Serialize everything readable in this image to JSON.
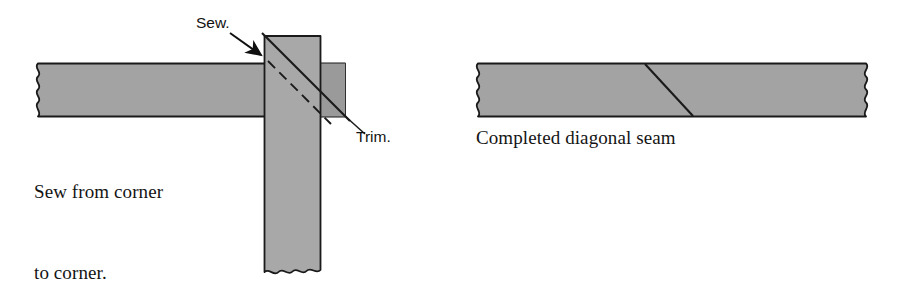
{
  "figure": {
    "background_color": "#ffffff",
    "fabric_fill": "#a3a3a3",
    "fabric_fill_overlap": "#999999",
    "outline_color": "#1a1a1a",
    "text_color": "#141414"
  },
  "panels": {
    "left": {
      "name": "sew-from-corner-panel",
      "caption_line_1": "Sew from corner",
      "caption_line_2": "to corner.",
      "annotations": {
        "sew": {
          "label": "Sew.",
          "icon": "arrow-icon",
          "points_to": "top-left-corner-of-vertical-strip"
        },
        "trim": {
          "label": "Trim.",
          "icon": "leader-line-icon",
          "points_to": "end-of-diagonal-cut-line"
        }
      },
      "shapes": {
        "horizontal_strip": "fabric-strip-horizontal",
        "vertical_strip": "fabric-strip-vertical",
        "stitch_line": "dashed-stitching-line",
        "cut_line": "solid-diagonal-cut-line"
      }
    },
    "right": {
      "name": "completed-seam-panel",
      "caption": "Completed diagonal seam",
      "shapes": {
        "joined_strip": "fabric-strip-joined",
        "seam_line": "diagonal-seam-line"
      }
    }
  }
}
